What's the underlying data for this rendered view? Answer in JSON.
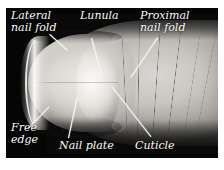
{
  "figure": {
    "kind": "anatomical-photograph",
    "background_color": "#ffffff",
    "photo_background_color": "#050505",
    "label_color": "#fdfdfb",
    "leader_color": "#f2f2f0"
  },
  "labels": [
    {
      "id": "lateral-nail-fold",
      "text": "Lateral\nnail fold"
    },
    {
      "id": "lunula",
      "text": "Lunula"
    },
    {
      "id": "proximal-nail-fold",
      "text": "Proximal\nnail fold"
    },
    {
      "id": "free-edge",
      "text": "Free\nedge"
    },
    {
      "id": "nail-plate",
      "text": "Nail plate"
    },
    {
      "id": "cuticle",
      "text": "Cuticle"
    }
  ]
}
